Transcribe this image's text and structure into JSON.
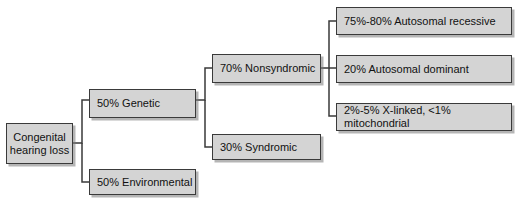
{
  "diagram": {
    "colors": {
      "node_fill": "#d4d4d4",
      "node_border": "#3a3a3a",
      "connector": "#3a3a3a",
      "background": "#ffffff"
    },
    "nodes": {
      "root": "Congenital\nhearing loss",
      "root_line1": "Congenital",
      "root_line2": "hearing loss",
      "genetic": "50% Genetic",
      "environmental": "50% Environmental",
      "nonsyndromic": "70% Nonsyndromic",
      "syndromic": "30% Syndromic",
      "autosomal_recessive": "75%-80% Autosomal recessive",
      "autosomal_dominant": "20% Autosomal dominant",
      "x_linked_mitochondrial": "2%-5% X-linked, <1% mitochondrial"
    }
  }
}
